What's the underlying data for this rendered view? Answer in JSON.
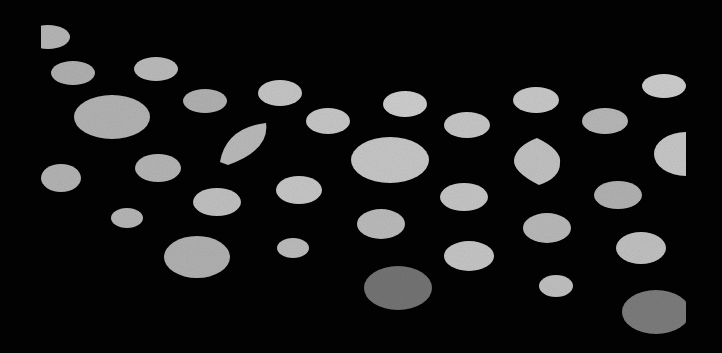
{
  "image": {
    "description": "Photograph of circular and elliptical paper/fabric disc samples arranged in staggered rows on a black background",
    "background_color": "#020202",
    "disc_count": 38,
    "tones": {
      "light": "#cfcfcf",
      "mid": "#b4b4b4",
      "dark": "#787878"
    }
  }
}
